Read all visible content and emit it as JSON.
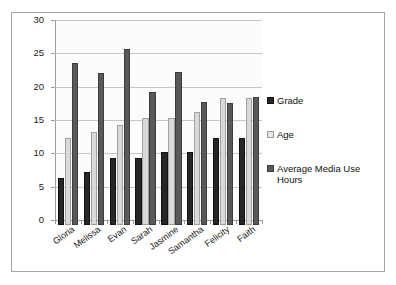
{
  "chart_data": {
    "type": "bar",
    "title": "",
    "subtitle": "",
    "xlabel": "",
    "ylabel": "",
    "ylim": [
      0,
      30
    ],
    "ytick_step": 5,
    "yticks": [
      "30",
      "25",
      "20",
      "15",
      "10",
      "5",
      "0"
    ],
    "grid": true,
    "grid_axis": "y",
    "legend_position": "right",
    "categories": [
      "Gloria",
      "Melissa",
      "Evan",
      "Sarah",
      "Jasmine",
      "Samantha",
      "Felicity",
      "Faith"
    ],
    "series": [
      {
        "name": "Grade",
        "color": "#262626",
        "values": [
          7,
          8,
          10,
          10,
          11,
          11,
          13,
          13
        ]
      },
      {
        "name": "Age",
        "color": "#d9d9d9",
        "values": [
          13,
          14,
          15,
          16,
          16,
          17,
          19,
          19
        ]
      },
      {
        "name": "Average Media Use Hours",
        "color": "#595959",
        "values": [
          24.3,
          22.8,
          26.4,
          20,
          23,
          18.5,
          18.3,
          19.2
        ]
      }
    ]
  },
  "legend": {
    "items": [
      {
        "label": "Grade",
        "swatch": "grade"
      },
      {
        "label": "Age",
        "swatch": "age"
      },
      {
        "label": "Average Media Use Hours",
        "swatch": "media"
      }
    ]
  }
}
